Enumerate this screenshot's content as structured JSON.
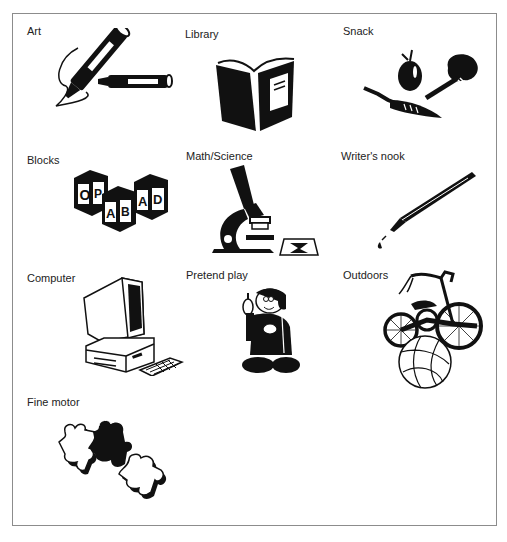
{
  "centers": [
    {
      "label": "Art",
      "icon": "marker-pens-icon"
    },
    {
      "label": "Library",
      "icon": "open-book-icon"
    },
    {
      "label": "Snack",
      "icon": "fruit-vegetables-icon"
    },
    {
      "label": "Blocks",
      "icon": "alphabet-blocks-icon"
    },
    {
      "label": "Math/Science",
      "icon": "microscope-icon"
    },
    {
      "label": "Writer's nook",
      "icon": "fountain-pen-icon"
    },
    {
      "label": "Computer",
      "icon": "desktop-computer-icon"
    },
    {
      "label": "Pretend play",
      "icon": "costumed-child-icon"
    },
    {
      "label": "Outdoors",
      "icon": "tricycle-ball-icon"
    },
    {
      "label": "Fine motor",
      "icon": "puzzle-pieces-icon"
    }
  ],
  "blocks_letters": [
    "O",
    "P",
    "A",
    "B",
    "A",
    "D"
  ],
  "colors": {
    "ink": "#111111",
    "border": "#8c8c8c",
    "background": "#ffffff"
  }
}
